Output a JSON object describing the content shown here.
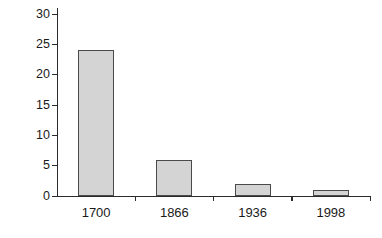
{
  "chart_data": {
    "type": "bar",
    "title": "",
    "subtitle": "",
    "xlabel": "",
    "ylabel": "% in agriculture",
    "categories": [
      "1700",
      "1866",
      "1936",
      "1998"
    ],
    "values": [
      24,
      5.9,
      2,
      1
    ],
    "series": [
      {
        "name": "% in agriculture",
        "values": [
          24,
          5.9,
          2,
          1
        ]
      }
    ],
    "ylim": [
      0,
      30
    ],
    "y_ticks": [
      0,
      5,
      10,
      15,
      20,
      25,
      30
    ],
    "y_tick_labels": [
      "0",
      "5",
      "10",
      "15",
      "20",
      "25",
      "30"
    ],
    "grid": false,
    "legend": false,
    "legend_position": "none",
    "annotations": [],
    "colors": {
      "bar_fill": "#d4d4d4",
      "bar_border": "#4a4a4a",
      "axis": "#2b2b2b",
      "text": "#1a1a1a",
      "background": "#ffffff"
    }
  }
}
